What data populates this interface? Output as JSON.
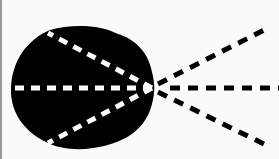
{
  "diagram": {
    "colors": {
      "background": "#fafafa",
      "blob": "#000000",
      "inner_dash": "#ffffff",
      "outer_dash": "#000000",
      "border": "#9a9a9a"
    },
    "focal_point": [
      152,
      88
    ],
    "rays": [
      {
        "name": "upper",
        "outer_end": [
          270,
          27
        ],
        "inner_end": [
          48,
          33
        ]
      },
      {
        "name": "middle",
        "outer_end": [
          279,
          88
        ],
        "inner_end": [
          10,
          88
        ]
      },
      {
        "name": "lower",
        "outer_end": [
          270,
          147
        ],
        "inner_end": [
          48,
          143
        ]
      }
    ]
  }
}
